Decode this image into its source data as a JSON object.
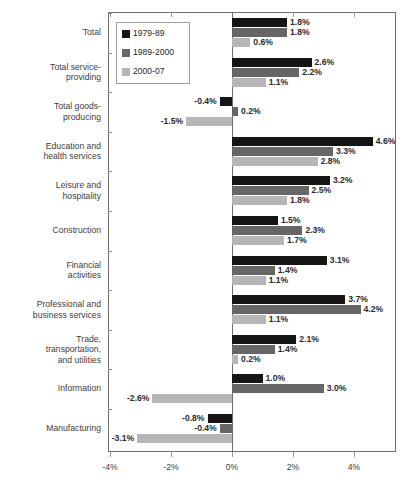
{
  "chart_data": {
    "type": "bar",
    "orientation": "horizontal",
    "title": "",
    "xlabel": "",
    "ylabel": "",
    "xlim": [
      -4.8,
      5.4
    ],
    "grid": false,
    "legend_position": "top-left-inside",
    "xticks": [
      -4,
      -2,
      0,
      2,
      4
    ],
    "xtick_labels": [
      "-4%",
      "-2%",
      "0%",
      "2%",
      "4%"
    ],
    "categories": [
      "Total",
      "Total service-providing",
      "Total goods-producing",
      "Education and health services",
      "Leisure and hospitality",
      "Construction",
      "Financial activities",
      "Professional and business services",
      "Trade, transportation, and utilities",
      "Information",
      "Manufacturing"
    ],
    "category_label_lines": [
      [
        "Total"
      ],
      [
        "Total service-",
        "providing"
      ],
      [
        "Total goods-",
        "producing"
      ],
      [
        "Education and",
        "health services"
      ],
      [
        "Leisure and",
        "hospitality"
      ],
      [
        "Construction"
      ],
      [
        "Financial",
        "activities"
      ],
      [
        "Professional and",
        "business services"
      ],
      [
        "Trade,",
        "transportation,",
        "and utilities"
      ],
      [
        "Information"
      ],
      [
        "Manufacturing"
      ]
    ],
    "series": [
      {
        "name": "1979-89",
        "color": "#151515",
        "values": [
          1.8,
          2.6,
          -0.4,
          4.6,
          3.2,
          1.5,
          3.1,
          3.7,
          2.1,
          1.0,
          -0.8
        ],
        "labels": [
          "1.8%",
          "2.6%",
          "-0.4%",
          "4.6%",
          "3.2%",
          "1.5%",
          "3.1%",
          "3.7%",
          "2.1%",
          "1.0%",
          "-0.8%"
        ]
      },
      {
        "name": "1989-2000",
        "color": "#666666",
        "values": [
          1.8,
          2.2,
          0.2,
          3.3,
          2.5,
          2.3,
          1.4,
          4.2,
          1.4,
          3.0,
          -0.4
        ],
        "labels": [
          "1.8%",
          "2.2%",
          "0.2%",
          "3.3%",
          "2.5%",
          "2.3%",
          "1.4%",
          "4.2%",
          "1.4%",
          "3.0%",
          "-0.4%"
        ]
      },
      {
        "name": "2000-07",
        "color": "#b6b6b6",
        "values": [
          0.6,
          1.1,
          -1.5,
          2.8,
          1.8,
          1.7,
          1.1,
          1.1,
          0.2,
          -2.6,
          -3.1
        ],
        "labels": [
          "0.6%",
          "1.1%",
          "-1.5%",
          "2.8%",
          "1.8%",
          "1.7%",
          "1.1%",
          "1.1%",
          "0.2%",
          "-2.6%",
          "-3.1%"
        ]
      }
    ]
  }
}
